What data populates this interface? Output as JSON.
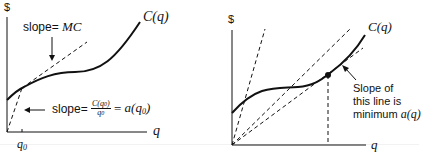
{
  "left_panel": {
    "y_axis_label": "$",
    "x_axis_label": "q",
    "curve_label": "C(q)",
    "x_tick_label": "q0",
    "mc_annotation": {
      "prefix": "slope= ",
      "value": "MC"
    },
    "avg_annotation": {
      "prefix": "slope= ",
      "fraction_numerator": "C(q0)",
      "fraction_denominator": "q0",
      "equals": " = ",
      "result": "a(q0)"
    }
  },
  "right_panel": {
    "y_axis_label": "$",
    "x_axis_label": "q",
    "curve_label": "C(q)",
    "annotation_lines": [
      "Slope of",
      "this line is",
      "minimum a(q)"
    ],
    "annotation_prefix": "minimum ",
    "annotation_math": "a(q)"
  },
  "colors": {
    "ink": "#111111",
    "background": "#ffffff"
  }
}
